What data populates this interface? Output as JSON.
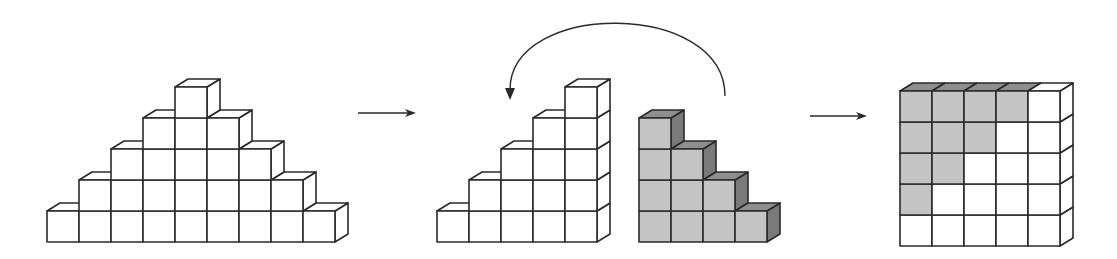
{
  "figure": {
    "cube": {
      "w": 32,
      "h": 31,
      "dx": 13,
      "dy": 8
    },
    "colors": {
      "white_front": "#ffffff",
      "white_top": "#ffffff",
      "white_side": "#ffffff",
      "gray_front": "#c4c4c4",
      "gray_top": "#8e8e8e",
      "gray_side": "#7a7a7a",
      "edge": "#2a2a2a"
    },
    "panels": [
      {
        "name": "pyramid",
        "origin_x": 47,
        "base_y": 242,
        "rows_counts": [
          9,
          7,
          5,
          3,
          1
        ],
        "fill": "white"
      },
      {
        "name": "left-staircase",
        "origin_x": 437,
        "base_y": 242,
        "staircase_heights": [
          1,
          2,
          3,
          4,
          5
        ],
        "fill": "white"
      },
      {
        "name": "right-staircase",
        "origin_x": 639,
        "base_y": 242,
        "staircase_heights": [
          4,
          3,
          2,
          1
        ],
        "fill": "gray"
      },
      {
        "name": "square",
        "origin_x": 900,
        "base_y": 246,
        "square_size": 5,
        "gray_cells": [
          [
            4,
            0
          ],
          [
            4,
            1
          ],
          [
            4,
            2
          ],
          [
            4,
            3
          ],
          [
            3,
            0
          ],
          [
            3,
            1
          ],
          [
            3,
            2
          ],
          [
            2,
            0
          ],
          [
            2,
            1
          ],
          [
            1,
            0
          ]
        ]
      }
    ],
    "arrows": [
      {
        "name": "arrow-step-1",
        "x1": 358,
        "y1": 113,
        "x2": 416,
        "y2": 113
      },
      {
        "name": "arrow-step-2",
        "x1": 810,
        "y1": 116,
        "x2": 867,
        "y2": 116
      }
    ],
    "rotate_arrow": {
      "start_x": 725,
      "start_y": 96,
      "ctrl_x": 620,
      "ctrl_y": -40,
      "end_x": 510,
      "end_y": 100
    }
  }
}
